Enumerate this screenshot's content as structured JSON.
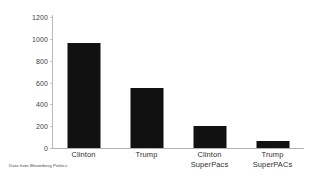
{
  "chart_data": {
    "type": "bar",
    "title": "",
    "subtitle": "",
    "xlabel": "",
    "ylabel": "Millions",
    "categories": [
      "Clinton",
      "Trump",
      "Clinton SuperPacs",
      "Trump SuperPACs"
    ],
    "category_lines": [
      [
        "Clinton"
      ],
      [
        "Trump"
      ],
      [
        "Clinton",
        "SuperPacs"
      ],
      [
        "Trump SuperPACs"
      ]
    ],
    "values": [
      965,
      550,
      205,
      65
    ],
    "ylim": [
      0,
      1200
    ],
    "ytick_labels": [
      "1200",
      "1000",
      "800",
      "600",
      "400",
      "200",
      "0"
    ],
    "ytick_values": [
      1200,
      1000,
      800,
      600,
      400,
      200,
      0
    ],
    "grid": false,
    "legend": false,
    "legend_position": "none",
    "bar_color": "#111111",
    "axis_color": "#b8b8b8",
    "text_color": "#2f2f2f",
    "annotations": [
      "Data from Bloomberg Politics"
    ]
  },
  "caption": {
    "source_note": "Data from Bloomberg Politics"
  }
}
